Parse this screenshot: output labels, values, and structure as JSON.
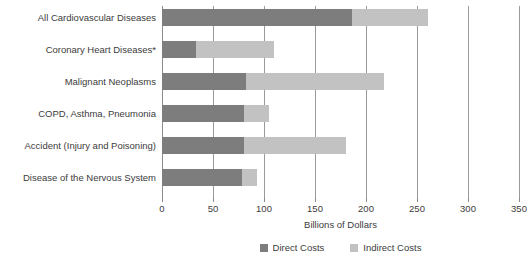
{
  "chart_data": {
    "type": "bar",
    "orientation": "horizontal",
    "stacked": true,
    "title": "",
    "xlabel": "Billions of Dollars",
    "ylabel": "",
    "xlim": [
      0,
      350
    ],
    "xticks": [
      0,
      50,
      100,
      150,
      200,
      250,
      300,
      350
    ],
    "xtick_labels": [
      "0",
      "50",
      "100",
      "150",
      "200",
      "250",
      "300",
      "350"
    ],
    "grid": true,
    "grid_axis": "x",
    "legend_position": "bottom-right",
    "categories": [
      "All Cardiovascular Diseases",
      "Coronary Heart Diseases*",
      "Malignant Neoplasms",
      "COPD, Asthma, Pneumonia",
      "Accident (Injury and Poisoning)",
      "Disease of the Nervous System"
    ],
    "series": [
      {
        "name": "Direct Costs",
        "color": "#7d7d7d",
        "values": [
          186,
          33,
          82,
          80,
          80,
          78
        ]
      },
      {
        "name": "Indirect Costs",
        "color": "#c2c2c2",
        "values": [
          75,
          77,
          136,
          25,
          100,
          15
        ]
      }
    ],
    "totals": [
      261,
      110,
      218,
      105,
      180,
      93
    ]
  },
  "axis": {
    "x_title": "Billions of Dollars"
  },
  "legend": {
    "items": [
      {
        "label": "Direct Costs",
        "color": "#7d7d7d"
      },
      {
        "label": "Indirect Costs",
        "color": "#c2c2c2"
      }
    ]
  }
}
